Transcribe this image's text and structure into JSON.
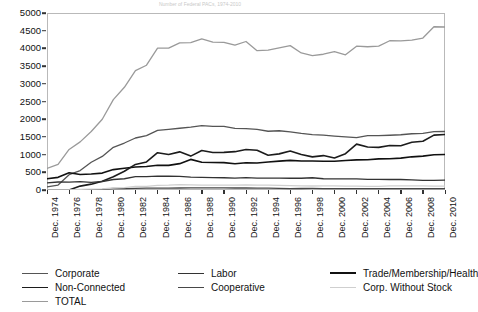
{
  "chart_title_faint": "Number of Federal PACs, 1974-2010",
  "chart_data": {
    "type": "line",
    "title": "",
    "xlabel": "",
    "ylabel": "",
    "ylim": [
      0,
      5000
    ],
    "ytick_step": 500,
    "yticks": [
      0,
      500,
      1000,
      1500,
      2000,
      2500,
      3000,
      3500,
      4000,
      4500,
      5000
    ],
    "grid": false,
    "legend_position": "bottom",
    "x_label_prefix": "Dec.",
    "x_tick_years": [
      1974,
      1976,
      1978,
      1980,
      1982,
      1984,
      1986,
      1988,
      1990,
      1992,
      1994,
      1996,
      1998,
      2000,
      2002,
      2004,
      2006,
      2008,
      2010
    ],
    "categories": [
      "Dec. 1974",
      "Dec. 1975",
      "Dec. 1976",
      "Dec. 1977",
      "Dec. 1978",
      "Dec. 1979",
      "Dec. 1980",
      "Dec. 1981",
      "Dec. 1982",
      "Dec. 1983",
      "Dec. 1984",
      "Dec. 1985",
      "Dec. 1986",
      "Dec. 1987",
      "Dec. 1988",
      "Dec. 1989",
      "Dec. 1990",
      "Dec. 1991",
      "Dec. 1992",
      "Dec. 1993",
      "Dec. 1994",
      "Dec. 1995",
      "Dec. 1996",
      "Dec. 1997",
      "Dec. 1998",
      "Dec. 1999",
      "Dec. 2000",
      "Dec. 2001",
      "Dec. 2002",
      "Dec. 2003",
      "Dec. 2004",
      "Dec. 2005",
      "Dec. 2006",
      "Dec. 2007",
      "Dec. 2008",
      "Dec. 2009",
      "Dec. 2010"
    ],
    "series": [
      {
        "name": "TOTAL",
        "color": "#9a9a9a",
        "width": 1.3,
        "values": [
          608,
          722,
          1146,
          1360,
          1653,
          2000,
          2551,
          2901,
          3371,
          3525,
          4009,
          4009,
          4157,
          4165,
          4268,
          4178,
          4172,
          4094,
          4195,
          3937,
          3954,
          4016,
          4079,
          3871,
          3798,
          3835,
          3907,
          3820,
          4063,
          4046,
          4066,
          4217,
          4210,
          4234,
          4292,
          4611,
          4604
        ]
      },
      {
        "name": "Corporate",
        "color": "#555555",
        "width": 1.3,
        "values": [
          89,
          139,
          433,
          550,
          785,
          949,
          1206,
          1327,
          1469,
          1538,
          1682,
          1710,
          1744,
          1775,
          1816,
          1796,
          1795,
          1738,
          1735,
          1715,
          1660,
          1674,
          1642,
          1597,
          1567,
          1548,
          1523,
          1500,
          1478,
          1538,
          1538,
          1547,
          1561,
          1589,
          1598,
          1650,
          1652
        ]
      },
      {
        "name": "Trade/Membership/Health",
        "color": "#111111",
        "width": 1.6,
        "values": [
          318,
          357,
          489,
          438,
          453,
          477,
          576,
          614,
          649,
          663,
          698,
          695,
          745,
          865,
          786,
          776,
          774,
          742,
          770,
          761,
          792,
          815,
          838,
          821,
          821,
          812,
          812,
          832,
          850,
          854,
          880,
          881,
          901,
          937,
          956,
          995,
          1001
        ]
      },
      {
        "name": "Non-Connected",
        "color": "#1c1c1c",
        "width": 1.6,
        "values": [
          0,
          0,
          0,
          110,
          165,
          250,
          374,
          531,
          723,
          793,
          1053,
          1003,
          1077,
          957,
          1115,
          1060,
          1062,
          1083,
          1145,
          1121,
          980,
          1020,
          1103,
          1002,
          935,
          972,
          902,
          1026,
          1296,
          1213,
          1204,
          1259,
          1251,
          1347,
          1378,
          1549,
          1569
        ]
      },
      {
        "name": "Labor",
        "color": "#333333",
        "width": 1.3,
        "values": [
          201,
          226,
          224,
          234,
          217,
          240,
          297,
          318,
          380,
          378,
          394,
          388,
          384,
          364,
          354,
          349,
          346,
          338,
          347,
          337,
          333,
          334,
          332,
          332,
          346,
          318,
          317,
          317,
          313,
          301,
          302,
          297,
          296,
          288,
          272,
          272,
          277
        ]
      },
      {
        "name": "Cooperative",
        "color": "#474747",
        "width": 1.3,
        "values": [
          0,
          0,
          0,
          8,
          12,
          17,
          42,
          41,
          47,
          51,
          52,
          54,
          56,
          59,
          59,
          59,
          59,
          57,
          56,
          53,
          53,
          44,
          41,
          42,
          45,
          41,
          40,
          38,
          39,
          38,
          38,
          39,
          39,
          39,
          38,
          38,
          38
        ]
      },
      {
        "name": "Corp. Without Stock",
        "color": "#cfcfcf",
        "width": 1.3,
        "values": [
          0,
          0,
          0,
          20,
          24,
          32,
          56,
          68,
          103,
          102,
          130,
          137,
          151,
          145,
          138,
          137,
          136,
          136,
          142,
          136,
          136,
          129,
          123,
          114,
          113,
          114,
          114,
          107,
          107,
          102,
          104,
          114,
          118,
          114,
          115,
          107,
          111
        ]
      }
    ]
  },
  "legend": {
    "items": [
      {
        "label": "Corporate",
        "color": "#555555",
        "width": 1.4,
        "col": 0,
        "row": 0
      },
      {
        "label": "Labor",
        "color": "#333333",
        "width": 1.4,
        "col": 1,
        "row": 0
      },
      {
        "label": "Trade/Membership/Health",
        "color": "#111111",
        "width": 2.0,
        "col": 2,
        "row": 0
      },
      {
        "label": "Non-Connected",
        "color": "#1c1c1c",
        "width": 1.8,
        "col": 0,
        "row": 1
      },
      {
        "label": "Cooperative",
        "color": "#474747",
        "width": 1.6,
        "col": 1,
        "row": 1
      },
      {
        "label": "Corp. Without Stock",
        "color": "#cfcfcf",
        "width": 1.4,
        "col": 2,
        "row": 1
      },
      {
        "label": "TOTAL",
        "color": "#9a9a9a",
        "width": 1.4,
        "col": 0,
        "row": 2
      }
    ]
  }
}
